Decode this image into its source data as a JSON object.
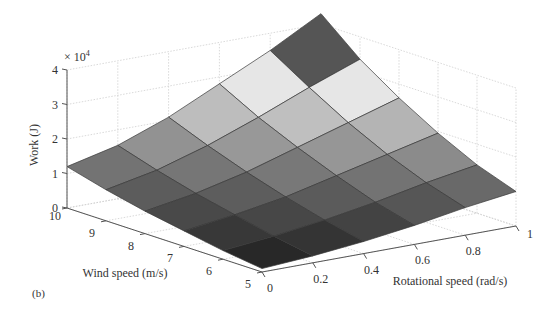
{
  "figure": {
    "panel_label": "(b)"
  },
  "chart_data": {
    "type": "surface3d",
    "title": "",
    "xlabel": "Rotational speed (rad/s)",
    "ylabel": "Wind speed (m/s)",
    "zlabel": "Work (J)",
    "z_exponent_label": "× 10",
    "z_exponent_power": "4",
    "xlim": [
      0,
      1
    ],
    "ylim": [
      5,
      10
    ],
    "zlim": [
      0,
      40000
    ],
    "x_ticks": [
      "0",
      "0.2",
      "0.4",
      "0.6",
      "0.8",
      "1"
    ],
    "y_ticks": [
      "5",
      "6",
      "7",
      "8",
      "9",
      "10"
    ],
    "z_ticks": [
      "0",
      "1",
      "2",
      "3",
      "4"
    ],
    "grid": true,
    "colormap": "gray",
    "x": [
      0,
      0.2,
      0.4,
      0.6,
      0.8,
      1.0
    ],
    "y": [
      5,
      6,
      7,
      8,
      9,
      10
    ],
    "z_description": "Work increases with both rotational speed and wind speed; z[i][j] for y[i], x[j]",
    "z": [
      [
        1000,
        2000,
        3500,
        5500,
        8000,
        10000
      ],
      [
        2500,
        4000,
        6000,
        8500,
        11500,
        14000
      ],
      [
        4500,
        6500,
        9000,
        12500,
        16000,
        19500
      ],
      [
        6500,
        9000,
        12500,
        17000,
        21500,
        26000
      ],
      [
        9000,
        12000,
        16500,
        22000,
        28000,
        33500
      ],
      [
        12000,
        15500,
        21000,
        28000,
        35000,
        43000
      ]
    ]
  }
}
